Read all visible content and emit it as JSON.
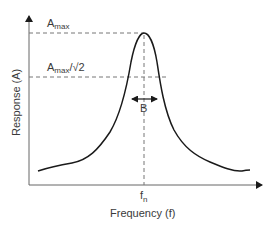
{
  "diagram": {
    "x_axis_label": "Frequency (f)",
    "y_axis_label": "Response (A)",
    "peak_label": "A",
    "peak_label_sub": "max",
    "half_power_label": "A",
    "half_power_label_sub": "max",
    "half_power_label_suffix": "/√2",
    "bandwidth_label": "B",
    "natural_freq_label": "f",
    "natural_freq_sub": "n",
    "colors": {
      "curve": "#1a1a1a",
      "axes": "#555555",
      "dashed": "#777777",
      "text": "#3a3a3a"
    }
  }
}
